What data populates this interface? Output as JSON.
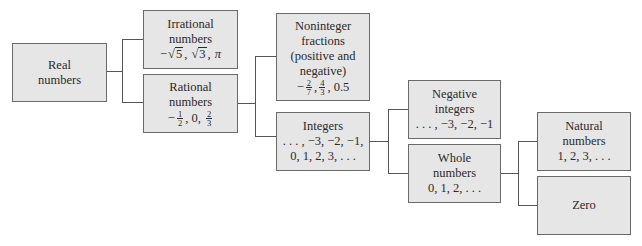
{
  "diagram": {
    "nodes": {
      "real": {
        "lines": [
          "Real",
          "numbers"
        ]
      },
      "irrational": {
        "lines": [
          "Irrational",
          "numbers"
        ],
        "examples": [
          "−",
          "√",
          "5",
          ", ",
          "√",
          "3",
          ", ",
          "π"
        ],
        "examples_text": "−√5, √3, π"
      },
      "rational": {
        "lines": [
          "Rational",
          "numbers"
        ],
        "examples_text": "−1/2, 0, 2/3",
        "ex": {
          "neg": "−",
          "f1_num": "1",
          "f1_den": "2",
          "mid": ", 0, ",
          "f2_num": "2",
          "f2_den": "3"
        }
      },
      "noninteger": {
        "lines": [
          "Noninteger",
          "fractions",
          "(positive and",
          "negative)"
        ],
        "examples_text": "−2/7, 4/3, 0.5",
        "ex": {
          "neg": "−",
          "f1_num": "2",
          "f1_den": "7",
          "sep": ",",
          "f2_num": "4",
          "f2_den": "3",
          "tail": ", 0.5"
        }
      },
      "integers": {
        "lines": [
          "Integers",
          ". . . , −3, −2, −1,",
          "0, 1, 2, 3, . . ."
        ]
      },
      "negative_integers": {
        "lines": [
          "Negative",
          "integers",
          ". . . , −3, −2, −1"
        ]
      },
      "whole": {
        "lines": [
          "Whole",
          "numbers",
          "0, 1, 2, . . ."
        ]
      },
      "natural": {
        "lines": [
          "Natural",
          "numbers",
          "1, 2, 3, . . ."
        ]
      },
      "zero": {
        "lines": [
          "Zero"
        ]
      }
    },
    "edges": [
      [
        "real",
        "irrational"
      ],
      [
        "real",
        "rational"
      ],
      [
        "rational",
        "noninteger"
      ],
      [
        "rational",
        "integers"
      ],
      [
        "integers",
        "negative_integers"
      ],
      [
        "integers",
        "whole"
      ],
      [
        "whole",
        "natural"
      ],
      [
        "whole",
        "zero"
      ]
    ],
    "colors": {
      "box_fill": "#e6e6e6",
      "box_border": "#6a6a6a",
      "connector": "#555555",
      "text": "#2a2a2a"
    }
  }
}
